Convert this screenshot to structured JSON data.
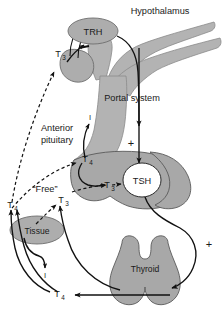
{
  "figure": {
    "background_color": "#ffffff",
    "organ_fill_color": "#a8a8a8",
    "vessel_fill_color": "#b3b3b3",
    "line_color": "#111111"
  },
  "labels": {
    "hypothalamus": "Hypothalamus",
    "trh": "TRH",
    "portal_system": "Portal system",
    "anterior_pituitary_line1": "Anterior",
    "anterior_pituitary_line2": "pituitary",
    "tsh": "TSH",
    "thyroid": "Thyroid",
    "tissue": "Tissue",
    "free": "“Free”"
  },
  "hormones": {
    "t3_hypothalamus": {
      "base": "T",
      "sub": "3"
    },
    "t4_pituitary": {
      "base": "T",
      "sub": "4"
    },
    "t3_pituitary": {
      "base": "T",
      "sub": "3"
    },
    "t4_free": {
      "base": "T",
      "sub": "4"
    },
    "t3_free": {
      "base": "T",
      "sub": "3"
    },
    "t4_thyroid_output": {
      "base": "T",
      "sub": "4"
    }
  },
  "iodine": {
    "pituitary_iodine": "I",
    "tissue_iodine": "I"
  },
  "signs": {
    "minus_trh": "−",
    "plus_portal": "+",
    "plus_thyroid": "+"
  },
  "legend_notes": {
    "solid_arrow_meaning": "conversion / secretion pathway",
    "dashed_arrow_meaning": "negative feedback",
    "plus_meaning": "stimulation",
    "minus_meaning": "inhibition"
  }
}
